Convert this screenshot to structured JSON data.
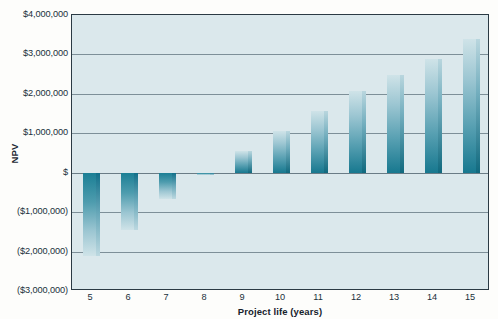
{
  "chart_data": {
    "type": "bar",
    "title": "",
    "xlabel": "Project life (years)",
    "ylabel": "NPV",
    "categories": [
      "5",
      "6",
      "7",
      "8",
      "9",
      "10",
      "11",
      "12",
      "13",
      "14",
      "15"
    ],
    "values": [
      -2100000,
      -1450000,
      -670000,
      -50000,
      540000,
      1050000,
      1570000,
      2060000,
      2490000,
      2890000,
      3380000
    ],
    "ylim": [
      -3000000,
      4000000
    ],
    "ytick_values": [
      4000000,
      3000000,
      2000000,
      1000000,
      0,
      -1000000,
      -2000000,
      -3000000
    ],
    "ytick_labels": [
      "$4,000,000",
      "$3,000,000",
      "$2,000,000",
      "$1,000,000",
      "$",
      "($1,000,000)",
      "($2,000,000)",
      "($3,000,000)"
    ],
    "grid": true,
    "legend": "none",
    "colors": {
      "bar_top": "#cfe3e8",
      "bar_bottom": "#17788f",
      "bar_side": "#10697e",
      "plot_background": "#dbe8ec",
      "gridline": "#7d8f98",
      "axis_border": "#2b3a44",
      "page_background": "#fdfdfb",
      "text": "#20303a"
    }
  }
}
